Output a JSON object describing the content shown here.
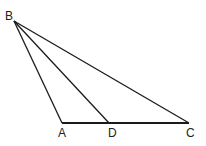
{
  "diagram": {
    "type": "triangle",
    "points": {
      "B": {
        "label": "B",
        "x": 14,
        "y": 21
      },
      "A": {
        "label": "A",
        "x": 62,
        "y": 123
      },
      "D": {
        "label": "D",
        "x": 109,
        "y": 123
      },
      "C": {
        "label": "C",
        "x": 189,
        "y": 123
      }
    },
    "segments": [
      "BA",
      "BD",
      "BC",
      "AC"
    ],
    "stroke_color": "#1a1a1a"
  }
}
